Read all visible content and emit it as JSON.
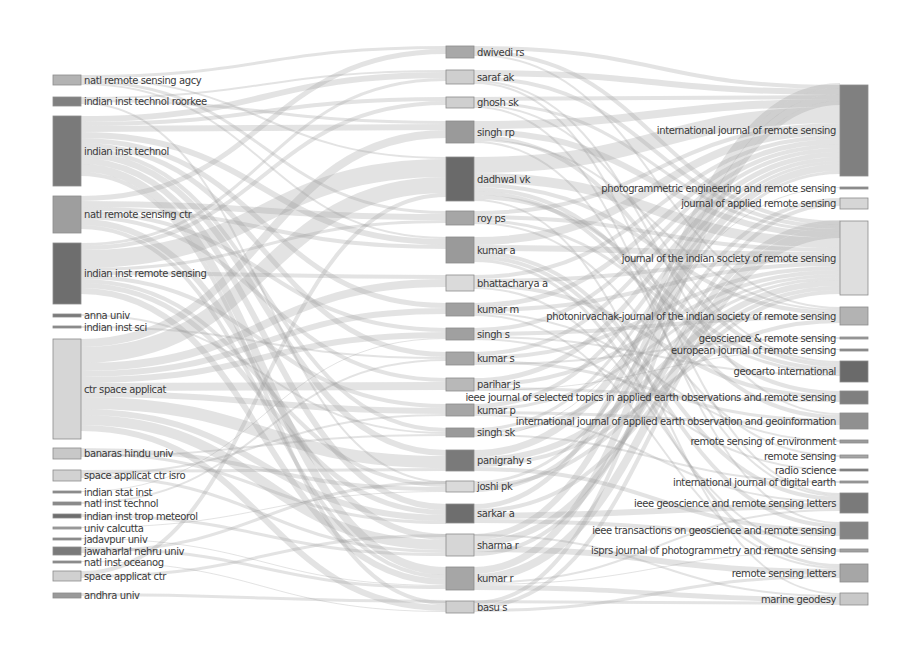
{
  "diagram": {
    "type": "sankey",
    "columns": [
      "institutions",
      "authors",
      "journals"
    ],
    "institutions": [
      {
        "label": "natl remote sensing agcy",
        "y": 75,
        "h": 10,
        "shade": "#b3b3b3"
      },
      {
        "label": "indian inst technol roorkee",
        "y": 97,
        "h": 9,
        "shade": "#808080"
      },
      {
        "label": "indian inst technol",
        "y": 116,
        "h": 70,
        "shade": "#7a7a7a"
      },
      {
        "label": "natl remote sensing ctr",
        "y": 196,
        "h": 37,
        "shade": "#9e9e9e"
      },
      {
        "label": "indian inst remote sensing",
        "y": 243,
        "h": 61,
        "shade": "#6e6e6e"
      },
      {
        "label": "anna univ",
        "y": 314,
        "h": 3,
        "shade": "#7a7a7a"
      },
      {
        "label": "indian inst sci",
        "y": 326,
        "h": 2,
        "shade": "#8a8a8a"
      },
      {
        "label": "ctr space applicat",
        "y": 339,
        "h": 100,
        "shade": "#d6d6d6"
      },
      {
        "label": "banaras hindu univ",
        "y": 448,
        "h": 11,
        "shade": "#c8c8c8"
      },
      {
        "label": "space applicat ctr isro",
        "y": 470,
        "h": 11,
        "shade": "#d2d2d2"
      },
      {
        "label": "indian stat inst",
        "y": 491,
        "h": 2,
        "shade": "#8a8a8a"
      },
      {
        "label": "natl inst technol",
        "y": 502,
        "h": 3,
        "shade": "#8a8a8a"
      },
      {
        "label": "indian inst trop meteorol",
        "y": 514,
        "h": 4,
        "shade": "#6e6e6e"
      },
      {
        "label": "univ calcutta",
        "y": 527,
        "h": 2,
        "shade": "#a0a0a0"
      },
      {
        "label": "jadavpur univ",
        "y": 538,
        "h": 2,
        "shade": "#8a8a8a"
      },
      {
        "label": "jawaharlal nehru univ",
        "y": 547,
        "h": 8,
        "shade": "#7a7a7a"
      },
      {
        "label": "natl inst oceanog",
        "y": 561,
        "h": 2,
        "shade": "#8a8a8a"
      },
      {
        "label": "space applicat ctr",
        "y": 571,
        "h": 10,
        "shade": "#d0d0d0"
      },
      {
        "label": "andhra univ",
        "y": 593,
        "h": 5,
        "shade": "#9a9a9a"
      }
    ],
    "authors": [
      {
        "label": "dwivedi rs",
        "y": 46,
        "h": 12,
        "shade": "#a8a8a8"
      },
      {
        "label": "saraf ak",
        "y": 70,
        "h": 14,
        "shade": "#cfcfcf"
      },
      {
        "label": "ghosh sk",
        "y": 97,
        "h": 11,
        "shade": "#cfcfcf"
      },
      {
        "label": "singh rp",
        "y": 121,
        "h": 22,
        "shade": "#9a9a9a"
      },
      {
        "label": "dadhwal vk",
        "y": 157,
        "h": 44,
        "shade": "#6a6a6a"
      },
      {
        "label": "roy ps",
        "y": 211,
        "h": 14,
        "shade": "#a6a6a6"
      },
      {
        "label": "kumar a",
        "y": 237,
        "h": 26,
        "shade": "#9a9a9a"
      },
      {
        "label": "bhattacharya a",
        "y": 275,
        "h": 16,
        "shade": "#dadada"
      },
      {
        "label": "kumar m",
        "y": 303,
        "h": 13,
        "shade": "#a0a0a0"
      },
      {
        "label": "singh s",
        "y": 328,
        "h": 12,
        "shade": "#a0a0a0"
      },
      {
        "label": "kumar s",
        "y": 352,
        "h": 13,
        "shade": "#a6a6a6"
      },
      {
        "label": "parihar js",
        "y": 378,
        "h": 13,
        "shade": "#b8b8b8"
      },
      {
        "label": "kumar p",
        "y": 404,
        "h": 12,
        "shade": "#a6a6a6"
      },
      {
        "label": "singh sk",
        "y": 428,
        "h": 9,
        "shade": "#9a9a9a"
      },
      {
        "label": "panigrahy s",
        "y": 450,
        "h": 21,
        "shade": "#7a7a7a"
      },
      {
        "label": "joshi pk",
        "y": 481,
        "h": 11,
        "shade": "#dadada"
      },
      {
        "label": "sarkar a",
        "y": 504,
        "h": 19,
        "shade": "#6e6e6e"
      },
      {
        "label": "sharma r",
        "y": 534,
        "h": 22,
        "shade": "#d6d6d6"
      },
      {
        "label": "kumar r",
        "y": 567,
        "h": 23,
        "shade": "#a6a6a6"
      },
      {
        "label": "basu s",
        "y": 601,
        "h": 12,
        "shade": "#cfcfcf"
      }
    ],
    "journals": [
      {
        "label": "international journal of remote sensing",
        "y": 85,
        "h": 91,
        "shade": "#808080"
      },
      {
        "label": "photogrammetric engineering and remote sensing",
        "y": 187,
        "h": 2,
        "shade": "#8a8a8a"
      },
      {
        "label": "journal of applied remote sensing",
        "y": 198,
        "h": 11,
        "shade": "#d6d6d6"
      },
      {
        "label": "journal of the indian society of remote sensing",
        "y": 221,
        "h": 74,
        "shade": "#dedede"
      },
      {
        "label": "photonirvachak-journal of the indian society of remote sensing",
        "y": 307,
        "h": 18,
        "shade": "#b3b3b3"
      },
      {
        "label": "geoscience & remote sensing",
        "y": 337,
        "h": 2,
        "shade": "#9a9a9a"
      },
      {
        "label": "european journal of remote sensing",
        "y": 349,
        "h": 2,
        "shade": "#8a8a8a"
      },
      {
        "label": "geocarto international",
        "y": 361,
        "h": 21,
        "shade": "#6a6a6a"
      },
      {
        "label": "ieee journal of selected topics in applied earth observations and remote sensing",
        "y": 391,
        "h": 13,
        "shade": "#7f7f7f"
      },
      {
        "label": "international journal of applied earth observation and geoinformation",
        "y": 413,
        "h": 16,
        "shade": "#909090"
      },
      {
        "label": "remote sensing of environment",
        "y": 440,
        "h": 3,
        "shade": "#9a9a9a"
      },
      {
        "label": "remote sensing",
        "y": 455,
        "h": 3,
        "shade": "#a6a6a6"
      },
      {
        "label": "radio science",
        "y": 469,
        "h": 2,
        "shade": "#7a7a7a"
      },
      {
        "label": "international journal of digital earth",
        "y": 481,
        "h": 2,
        "shade": "#9a9a9a"
      },
      {
        "label": "ieee geoscience and remote sensing letters",
        "y": 493,
        "h": 20,
        "shade": "#7a7a7a"
      },
      {
        "label": "ieee transactions on geoscience and remote sensing",
        "y": 522,
        "h": 17,
        "shade": "#858585"
      },
      {
        "label": "isprs journal of photogrammetry and remote sensing",
        "y": 549,
        "h": 3,
        "shade": "#a0a0a0"
      },
      {
        "label": "remote sensing letters",
        "y": 564,
        "h": 18,
        "shade": "#a6a6a6"
      },
      {
        "label": "marine geodesy",
        "y": 593,
        "h": 12,
        "shade": "#c8c8c8"
      }
    ],
    "layout": {
      "col_x": [
        53,
        446,
        840
      ],
      "node_width": [
        28,
        28,
        28
      ],
      "flow_color": "#9a9a9a",
      "flow_opacity": 0.28,
      "background": "#ffffff"
    },
    "links_left": [
      [
        0,
        0,
        3
      ],
      [
        0,
        4,
        2
      ],
      [
        0,
        5,
        3
      ],
      [
        0,
        6,
        2
      ],
      [
        1,
        1,
        2
      ],
      [
        1,
        3,
        3
      ],
      [
        1,
        15,
        2
      ],
      [
        2,
        1,
        6
      ],
      [
        2,
        2,
        4
      ],
      [
        2,
        3,
        6
      ],
      [
        2,
        6,
        6
      ],
      [
        2,
        8,
        5
      ],
      [
        2,
        10,
        5
      ],
      [
        2,
        13,
        4
      ],
      [
        2,
        14,
        6
      ],
      [
        2,
        16,
        6
      ],
      [
        2,
        18,
        8
      ],
      [
        2,
        19,
        4
      ],
      [
        3,
        0,
        5
      ],
      [
        3,
        5,
        6
      ],
      [
        3,
        6,
        4
      ],
      [
        3,
        9,
        4
      ],
      [
        3,
        11,
        4
      ],
      [
        3,
        17,
        6
      ],
      [
        3,
        18,
        4
      ],
      [
        4,
        1,
        3
      ],
      [
        4,
        2,
        4
      ],
      [
        4,
        4,
        18
      ],
      [
        4,
        5,
        3
      ],
      [
        4,
        7,
        4
      ],
      [
        4,
        12,
        4
      ],
      [
        4,
        15,
        4
      ],
      [
        4,
        16,
        5
      ],
      [
        4,
        18,
        6
      ],
      [
        5,
        13,
        2
      ],
      [
        6,
        10,
        2
      ],
      [
        7,
        3,
        8
      ],
      [
        7,
        4,
        16
      ],
      [
        7,
        7,
        8
      ],
      [
        7,
        8,
        6
      ],
      [
        7,
        9,
        6
      ],
      [
        7,
        11,
        8
      ],
      [
        7,
        12,
        6
      ],
      [
        7,
        14,
        12
      ],
      [
        7,
        16,
        6
      ],
      [
        7,
        17,
        10
      ],
      [
        7,
        19,
        6
      ],
      [
        8,
        15,
        4
      ],
      [
        8,
        16,
        3
      ],
      [
        8,
        13,
        2
      ],
      [
        9,
        14,
        3
      ],
      [
        9,
        12,
        2
      ],
      [
        9,
        17,
        3
      ],
      [
        10,
        9,
        1
      ],
      [
        11,
        10,
        2
      ],
      [
        12,
        17,
        3
      ],
      [
        13,
        15,
        1
      ],
      [
        14,
        18,
        1
      ],
      [
        15,
        18,
        3
      ],
      [
        15,
        15,
        3
      ],
      [
        16,
        19,
        1
      ],
      [
        17,
        4,
        4
      ],
      [
        17,
        17,
        3
      ],
      [
        18,
        19,
        3
      ]
    ],
    "links_right": [
      [
        0,
        0,
        4
      ],
      [
        0,
        3,
        4
      ],
      [
        0,
        4,
        2
      ],
      [
        1,
        0,
        6
      ],
      [
        1,
        3,
        4
      ],
      [
        1,
        9,
        2
      ],
      [
        1,
        14,
        2
      ],
      [
        2,
        0,
        4
      ],
      [
        2,
        3,
        3
      ],
      [
        2,
        7,
        2
      ],
      [
        2,
        15,
        2
      ],
      [
        3,
        0,
        8
      ],
      [
        3,
        3,
        6
      ],
      [
        3,
        7,
        4
      ],
      [
        3,
        4,
        2
      ],
      [
        3,
        14,
        2
      ],
      [
        4,
        0,
        16
      ],
      [
        4,
        3,
        10
      ],
      [
        4,
        4,
        4
      ],
      [
        4,
        8,
        4
      ],
      [
        4,
        9,
        4
      ],
      [
        4,
        7,
        4
      ],
      [
        4,
        18,
        2
      ],
      [
        5,
        0,
        4
      ],
      [
        5,
        3,
        4
      ],
      [
        5,
        7,
        3
      ],
      [
        5,
        11,
        2
      ],
      [
        6,
        0,
        8
      ],
      [
        6,
        3,
        6
      ],
      [
        6,
        14,
        4
      ],
      [
        6,
        15,
        4
      ],
      [
        6,
        17,
        3
      ],
      [
        7,
        0,
        4
      ],
      [
        7,
        3,
        4
      ],
      [
        7,
        8,
        4
      ],
      [
        7,
        16,
        2
      ],
      [
        8,
        0,
        5
      ],
      [
        8,
        3,
        4
      ],
      [
        8,
        10,
        2
      ],
      [
        8,
        17,
        2
      ],
      [
        9,
        0,
        4
      ],
      [
        9,
        4,
        4
      ],
      [
        9,
        7,
        2
      ],
      [
        9,
        12,
        2
      ],
      [
        10,
        0,
        4
      ],
      [
        10,
        3,
        4
      ],
      [
        10,
        9,
        3
      ],
      [
        10,
        5,
        2
      ],
      [
        11,
        0,
        5
      ],
      [
        11,
        3,
        4
      ],
      [
        11,
        8,
        3
      ],
      [
        11,
        6,
        1
      ],
      [
        12,
        0,
        4
      ],
      [
        12,
        3,
        3
      ],
      [
        12,
        9,
        3
      ],
      [
        12,
        14,
        2
      ],
      [
        13,
        0,
        3
      ],
      [
        13,
        3,
        3
      ],
      [
        13,
        13,
        2
      ],
      [
        13,
        1,
        1
      ],
      [
        14,
        0,
        7
      ],
      [
        14,
        3,
        6
      ],
      [
        14,
        4,
        4
      ],
      [
        14,
        15,
        4
      ],
      [
        15,
        0,
        3
      ],
      [
        15,
        3,
        4
      ],
      [
        15,
        2,
        4
      ],
      [
        16,
        0,
        5
      ],
      [
        16,
        3,
        4
      ],
      [
        16,
        14,
        6
      ],
      [
        16,
        15,
        4
      ],
      [
        17,
        0,
        6
      ],
      [
        17,
        3,
        6
      ],
      [
        17,
        17,
        6
      ],
      [
        17,
        2,
        4
      ],
      [
        17,
        18,
        2
      ],
      [
        18,
        0,
        7
      ],
      [
        18,
        3,
        8
      ],
      [
        18,
        14,
        2
      ],
      [
        18,
        16,
        1
      ],
      [
        18,
        18,
        5
      ],
      [
        19,
        0,
        4
      ],
      [
        19,
        3,
        4
      ],
      [
        19,
        17,
        3
      ],
      [
        19,
        18,
        3
      ]
    ]
  }
}
